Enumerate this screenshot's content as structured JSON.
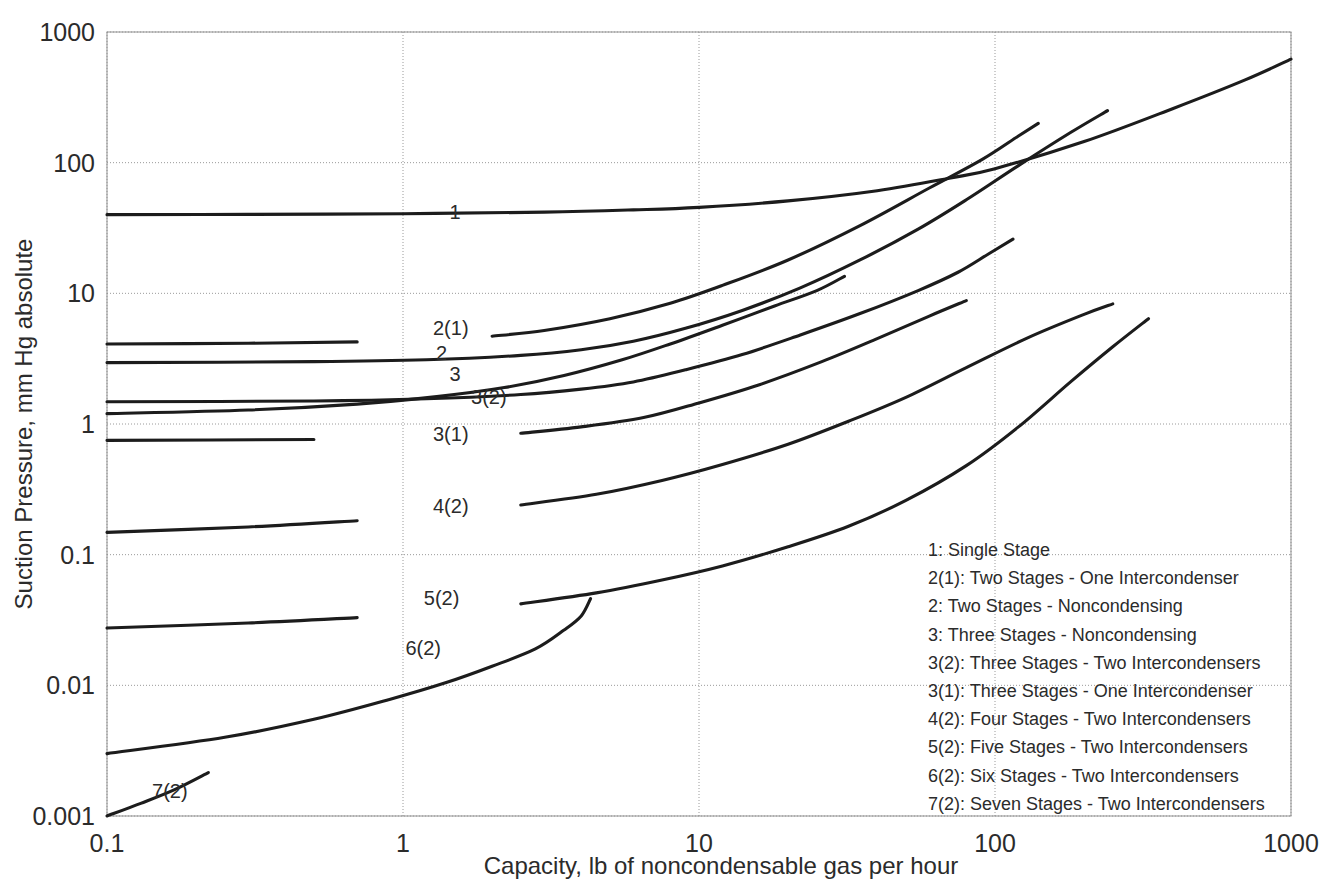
{
  "chart_data": {
    "type": "line",
    "title": "",
    "xlabel": "Capacity, lb of noncondensable gas per hour",
    "ylabel": "Suction Pressure, mm Hg absolute",
    "xscale": "log",
    "yscale": "log",
    "xlim": [
      0.1,
      1000
    ],
    "ylim": [
      0.001,
      1000
    ],
    "xticks": [
      "0.1",
      "1",
      "10",
      "100",
      "1000"
    ],
    "xtick_values": [
      0.1,
      1,
      10,
      100,
      1000
    ],
    "yticks": [
      "0.001",
      "0.01",
      "0.1",
      "1",
      "10",
      "100",
      "1000"
    ],
    "ytick_values": [
      0.001,
      0.01,
      0.1,
      1,
      10,
      100,
      1000
    ],
    "grid": true,
    "legend_position": "lower-right",
    "series": [
      {
        "name": "1",
        "label": "1: Single Stage",
        "label_text": "1",
        "label_x": 1.5,
        "label_y": 42,
        "points": [
          [
            0.1,
            40
          ],
          [
            0.3,
            40.2
          ],
          [
            1.0,
            40.7
          ],
          [
            3.0,
            41.8
          ],
          [
            6.0,
            43.5
          ],
          [
            10,
            45.5
          ],
          [
            20,
            51
          ],
          [
            40,
            61
          ],
          [
            70,
            76
          ],
          [
            100,
            90
          ],
          [
            200,
            145
          ],
          [
            400,
            260
          ],
          [
            700,
            430
          ],
          [
            1000,
            620
          ]
        ]
      },
      {
        "name": "2(1)",
        "label": "2(1): Two Stages - One Intercondenser",
        "label_text": "2(1)",
        "label_x": 1.45,
        "label_y": 5.4,
        "points": [
          [
            0.1,
            4.1
          ],
          [
            0.3,
            4.15
          ],
          [
            0.7,
            4.25
          ],
          [
            1.2,
            4.4
          ],
          [
            2.0,
            4.7
          ],
          [
            3.0,
            5.2
          ],
          [
            5.0,
            6.4
          ],
          [
            8.0,
            8.4
          ],
          [
            12,
            11.5
          ],
          [
            20,
            18
          ],
          [
            35,
            33
          ],
          [
            60,
            64
          ],
          [
            90,
            105
          ],
          [
            120,
            160
          ],
          [
            140,
            200
          ]
        ]
      },
      {
        "name": "2",
        "label": "2: Two Stages - Noncondensing",
        "label_text": "2",
        "label_x": 1.35,
        "label_y": 3.5,
        "points": [
          [
            0.1,
            2.95
          ],
          [
            0.5,
            3.0
          ],
          [
            1.2,
            3.1
          ],
          [
            2.5,
            3.35
          ],
          [
            4.0,
            3.7
          ],
          [
            6.0,
            4.3
          ],
          [
            9.0,
            5.4
          ],
          [
            14,
            7.4
          ],
          [
            22,
            11
          ],
          [
            35,
            18
          ],
          [
            55,
            31
          ],
          [
            80,
            52
          ],
          [
            120,
            95
          ],
          [
            180,
            170
          ],
          [
            240,
            250
          ]
        ]
      },
      {
        "name": "3",
        "label": "3: Three Stages - Noncondensing",
        "label_text": "3",
        "label_x": 1.5,
        "label_y": 2.4,
        "points": [
          [
            0.1,
            1.2
          ],
          [
            0.3,
            1.28
          ],
          [
            0.7,
            1.42
          ],
          [
            1.3,
            1.62
          ],
          [
            2.2,
            1.9
          ],
          [
            3.5,
            2.35
          ],
          [
            5.5,
            3.1
          ],
          [
            8.0,
            4.1
          ],
          [
            12,
            5.7
          ],
          [
            18,
            8.0
          ],
          [
            25,
            10.5
          ],
          [
            31,
            13.5
          ]
        ]
      },
      {
        "name": "3(2)",
        "label": "3(2): Three Stages - Two Intercondensers",
        "label_text": "3(2)",
        "label_x": 1.95,
        "label_y": 1.62,
        "points": [
          [
            0.1,
            1.48
          ],
          [
            0.5,
            1.5
          ],
          [
            1.2,
            1.56
          ],
          [
            2.5,
            1.68
          ],
          [
            4.0,
            1.85
          ],
          [
            6.0,
            2.1
          ],
          [
            9.0,
            2.6
          ],
          [
            14,
            3.4
          ],
          [
            22,
            4.8
          ],
          [
            35,
            7.0
          ],
          [
            55,
            10.5
          ],
          [
            75,
            14.5
          ],
          [
            95,
            20
          ],
          [
            115,
            26
          ]
        ]
      },
      {
        "name": "3(1)",
        "label": "3(1): Three Stages - One Intercondenser",
        "label_text": "3(1)",
        "label_x": 1.45,
        "label_y": 0.84,
        "points": [
          [
            0.1,
            0.75
          ],
          [
            0.5,
            0.76
          ],
          [
            1.2,
            0.79
          ],
          [
            2.5,
            0.85
          ],
          [
            4.0,
            0.95
          ],
          [
            6.5,
            1.12
          ],
          [
            10,
            1.45
          ],
          [
            16,
            2.0
          ],
          [
            26,
            3.0
          ],
          [
            40,
            4.5
          ],
          [
            60,
            6.7
          ],
          [
            80,
            8.8
          ]
        ]
      },
      {
        "name": "4(2)",
        "label": "4(2): Four Stages - Two Intercondensers",
        "label_text": "4(2)",
        "label_x": 1.45,
        "label_y": 0.235,
        "points": [
          [
            0.1,
            0.148
          ],
          [
            0.3,
            0.163
          ],
          [
            0.7,
            0.182
          ],
          [
            1.3,
            0.205
          ],
          [
            2.5,
            0.24
          ],
          [
            4.5,
            0.29
          ],
          [
            7.5,
            0.37
          ],
          [
            12,
            0.49
          ],
          [
            20,
            0.7
          ],
          [
            32,
            1.05
          ],
          [
            50,
            1.6
          ],
          [
            80,
            2.7
          ],
          [
            130,
            4.6
          ],
          [
            200,
            6.9
          ],
          [
            250,
            8.3
          ]
        ]
      },
      {
        "name": "5(2)",
        "label": "5(2): Five Stages - Two Intercondensers",
        "label_text": "5(2)",
        "label_x": 1.35,
        "label_y": 0.0465,
        "points": [
          [
            0.1,
            0.0275
          ],
          [
            0.3,
            0.03
          ],
          [
            0.7,
            0.033
          ],
          [
            1.3,
            0.036
          ],
          [
            2.5,
            0.042
          ],
          [
            4.5,
            0.051
          ],
          [
            7.5,
            0.064
          ],
          [
            12,
            0.082
          ],
          [
            20,
            0.115
          ],
          [
            32,
            0.165
          ],
          [
            50,
            0.26
          ],
          [
            80,
            0.48
          ],
          [
            120,
            0.95
          ],
          [
            180,
            2.1
          ],
          [
            250,
            3.9
          ],
          [
            330,
            6.4
          ]
        ]
      },
      {
        "name": "6(2)",
        "label": "6(2): Six Stages - Two Intercondensers",
        "label_text": "6(2)",
        "label_x": 1.17,
        "label_y": 0.0193,
        "points": [
          [
            0.1,
            0.003
          ],
          [
            0.25,
            0.004
          ],
          [
            0.5,
            0.0055
          ],
          [
            0.9,
            0.0078
          ],
          [
            1.4,
            0.0105
          ],
          [
            2.0,
            0.014
          ],
          [
            2.8,
            0.019
          ],
          [
            3.5,
            0.0265
          ],
          [
            4.0,
            0.034
          ],
          [
            4.3,
            0.046
          ]
        ]
      },
      {
        "name": "7(2)",
        "label": "7(2): Seven Stages - Two Intercondensers",
        "label_text": "7(2)",
        "label_x": 0.163,
        "label_y": 0.00155,
        "points": [
          [
            0.1,
            0.001
          ],
          [
            0.13,
            0.00125
          ],
          [
            0.17,
            0.0016
          ],
          [
            0.22,
            0.00215
          ]
        ]
      }
    ],
    "legend_entries": [
      "1: Single Stage",
      "2(1): Two Stages - One Intercondenser",
      "2: Two Stages - Noncondensing",
      "3: Three Stages - Noncondensing",
      "3(2): Three Stages - Two Intercondensers",
      "3(1): Three Stages - One Intercondenser",
      "4(2): Four Stages - Two Intercondensers",
      "5(2): Five Stages - Two Intercondensers",
      "6(2): Six Stages - Two Intercondensers",
      "7(2): Seven Stages - Two Intercondensers"
    ],
    "colors": {
      "curve": "#1c1c1c",
      "grid": "#9a9a9a",
      "text": "#2b2b2b",
      "background": "#ffffff"
    }
  }
}
